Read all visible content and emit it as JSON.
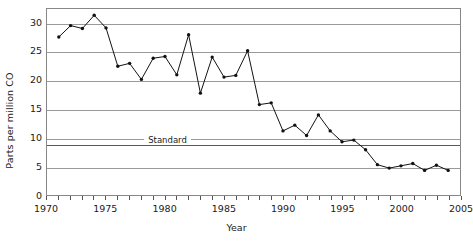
{
  "chart_data": {
    "type": "line",
    "title": "",
    "xlabel": "Year",
    "ylabel": "Parts per million CO",
    "xlim": [
      1970,
      2005
    ],
    "ylim": [
      0,
      32.5
    ],
    "y_ticks": [
      0,
      5,
      10,
      15,
      20,
      25,
      30
    ],
    "x_ticks": [
      1970,
      1975,
      1980,
      1985,
      1990,
      1995,
      2000,
      2005
    ],
    "x_tick_labels": [
      "1970",
      "1975",
      "1980",
      "1985",
      "1990",
      "1995",
      "2000",
      "2005"
    ],
    "x_minor_ticks_every": 1,
    "grid": "horizontal",
    "legend": "none",
    "markers": "filled-circle",
    "line_color": "#111111",
    "grid_color": "#9a9a9a",
    "annotations": [
      {
        "name": "standard-threshold",
        "label": "Standard",
        "value": 9,
        "orientation": "horizontal",
        "color": "#5a5a5a"
      }
    ],
    "series": [
      {
        "name": "Carbon monoxide",
        "x": [
          1971,
          1972,
          1973,
          1974,
          1975,
          1976,
          1977,
          1978,
          1979,
          1980,
          1981,
          1982,
          1983,
          1984,
          1985,
          1986,
          1987,
          1988,
          1989,
          1990,
          1991,
          1992,
          1993,
          1994,
          1995,
          1996,
          1997,
          1998,
          1999,
          2000,
          2001,
          2002,
          2003,
          2004
        ],
        "values": [
          27.6,
          29.6,
          29.1,
          31.4,
          29.2,
          22.5,
          23.0,
          20.2,
          23.9,
          24.2,
          21.0,
          28.0,
          17.8,
          24.1,
          20.6,
          20.9,
          25.2,
          15.8,
          16.1,
          11.2,
          12.2,
          10.4,
          14.0,
          11.2,
          9.3,
          9.6,
          7.9,
          5.3,
          4.7,
          5.1,
          5.5,
          4.3,
          5.2,
          4.3
        ]
      }
    ]
  }
}
